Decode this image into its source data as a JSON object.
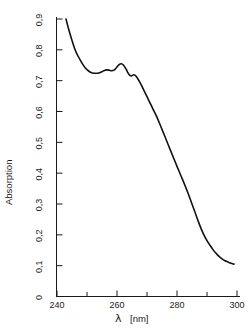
{
  "chart_data": {
    "type": "line",
    "title": "",
    "xlabel": "λ  [nm]",
    "xlabel_symbol": "λ",
    "xlabel_unit": "[nm]",
    "ylabel": "Absorption",
    "xlim": [
      240,
      300
    ],
    "ylim": [
      0,
      0.9
    ],
    "grid": false,
    "legend": null,
    "x_major_ticks": [
      240,
      260,
      280,
      300
    ],
    "x_major_tick_labels": [
      "240",
      "260",
      "280",
      "300"
    ],
    "x_minor_ticks": [
      250,
      270,
      290
    ],
    "y_major_ticks": [
      0,
      0.1,
      0.2,
      0.3,
      0.4,
      0.5,
      0.6,
      0.7,
      0.8,
      0.9
    ],
    "y_major_tick_labels": [
      "0",
      "0,1",
      "0,2",
      "0,3",
      "0,4",
      "0,5",
      "0,6",
      "0,7",
      "0,8",
      "0,9"
    ],
    "series": [
      {
        "name": "absorption",
        "color": "#111111",
        "x": [
          243.0,
          243.8,
          244.6,
          245.4,
          246.2,
          247.0,
          247.8,
          248.6,
          249.4,
          250.2,
          251.0,
          251.8,
          252.6,
          253.4,
          254.2,
          255.0,
          255.8,
          256.6,
          257.4,
          258.2,
          259.0,
          259.8,
          260.6,
          261.4,
          262.2,
          263.0,
          263.6,
          264.2,
          264.8,
          265.6,
          266.4,
          267.2,
          268.0,
          269.0,
          270.0,
          271.0,
          272.0,
          273.0,
          274.0,
          275.0,
          276.0,
          277.0,
          278.0,
          279.0,
          280.0,
          281.0,
          282.0,
          283.0,
          284.0,
          285.0,
          286.0,
          287.0,
          288.0,
          289.0,
          290.0,
          291.0,
          292.0,
          293.0,
          294.0,
          295.0,
          296.0,
          297.0,
          298.0,
          299.0
        ],
        "y": [
          0.9,
          0.87,
          0.843,
          0.818,
          0.796,
          0.78,
          0.766,
          0.753,
          0.742,
          0.734,
          0.728,
          0.725,
          0.724,
          0.724,
          0.726,
          0.729,
          0.733,
          0.735,
          0.734,
          0.732,
          0.734,
          0.742,
          0.751,
          0.755,
          0.75,
          0.738,
          0.726,
          0.718,
          0.715,
          0.719,
          0.714,
          0.702,
          0.688,
          0.668,
          0.648,
          0.628,
          0.608,
          0.588,
          0.566,
          0.542,
          0.518,
          0.494,
          0.47,
          0.446,
          0.422,
          0.399,
          0.376,
          0.352,
          0.327,
          0.3,
          0.273,
          0.246,
          0.221,
          0.199,
          0.181,
          0.166,
          0.152,
          0.14,
          0.13,
          0.122,
          0.116,
          0.112,
          0.108,
          0.105
        ]
      }
    ]
  },
  "axes": {
    "ylabel_text": "Absorption",
    "xlabel_symbol": "λ",
    "xlabel_unit": "[nm]"
  }
}
